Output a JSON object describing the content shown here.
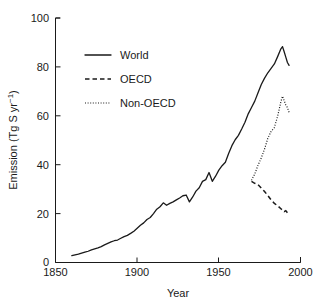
{
  "chart_data": {
    "type": "line",
    "title": "",
    "subtitle": "",
    "xlabel": "Year",
    "ylabel": "Emission (Tg S yr⁻¹)",
    "ylabel_text": "Emission (Tg S yr",
    "ylabel_sup": "−1",
    "ylabel_tail": ")",
    "xlim": [
      1850,
      2000
    ],
    "ylim": [
      0,
      100
    ],
    "grid": false,
    "legend_position": "upper-left-inside",
    "xticks": [
      1850,
      1900,
      1950,
      2000
    ],
    "xtick_labels": [
      "1850",
      "1900",
      "1950",
      "2000"
    ],
    "yticks": [
      0,
      20,
      40,
      60,
      80,
      100
    ],
    "ytick_labels": [
      "0",
      "20",
      "40",
      "60",
      "80",
      "100"
    ],
    "series": [
      {
        "name": "World",
        "style": "solid",
        "color": "#1a1a1a",
        "x": [
          1860,
          1862,
          1864,
          1866,
          1868,
          1870,
          1872,
          1874,
          1876,
          1878,
          1880,
          1882,
          1884,
          1886,
          1888,
          1890,
          1892,
          1894,
          1896,
          1898,
          1900,
          1902,
          1904,
          1906,
          1908,
          1910,
          1912,
          1914,
          1916,
          1918,
          1920,
          1922,
          1924,
          1926,
          1928,
          1930,
          1932,
          1934,
          1936,
          1938,
          1940,
          1942,
          1944,
          1946,
          1948,
          1950,
          1952,
          1954,
          1956,
          1958,
          1960,
          1962,
          1964,
          1966,
          1968,
          1970,
          1972,
          1974,
          1976,
          1978,
          1980,
          1982,
          1984,
          1986,
          1988,
          1989,
          1990,
          1991,
          1992,
          1993
        ],
        "y": [
          2.8,
          3.1,
          3.4,
          3.8,
          4.2,
          4.6,
          5.2,
          5.6,
          6.0,
          6.5,
          7.2,
          7.8,
          8.4,
          8.9,
          9.2,
          9.9,
          10.6,
          11.1,
          11.9,
          12.8,
          14.0,
          15.2,
          16.2,
          17.6,
          18.4,
          20.0,
          21.8,
          22.8,
          24.4,
          23.4,
          24.2,
          24.8,
          25.6,
          26.4,
          27.3,
          27.6,
          24.8,
          26.8,
          29.2,
          30.6,
          33.2,
          33.9,
          36.8,
          33.2,
          35.3,
          37.8,
          39.6,
          41.0,
          44.6,
          47.8,
          50.2,
          52.0,
          54.6,
          57.4,
          60.8,
          63.4,
          66.0,
          69.4,
          72.8,
          75.4,
          77.6,
          79.4,
          81.2,
          84.2,
          87.4,
          88.3,
          86.2,
          84.0,
          81.8,
          80.6
        ]
      },
      {
        "name": "OECD",
        "style": "dashed",
        "color": "#1a1a1a",
        "x": [
          1970,
          1972,
          1974,
          1976,
          1978,
          1980,
          1982,
          1984,
          1986,
          1988,
          1990,
          1991,
          1992,
          1993
        ],
        "y": [
          33.2,
          32.4,
          31.8,
          30.4,
          29.0,
          27.4,
          25.6,
          24.2,
          23.2,
          22.0,
          20.8,
          21.2,
          20.4,
          19.8
        ]
      },
      {
        "name": "Non-OECD",
        "style": "dotted",
        "color": "#1a1a1a",
        "x": [
          1970,
          1972,
          1974,
          1976,
          1978,
          1980,
          1982,
          1984,
          1986,
          1988,
          1989,
          1990,
          1991,
          1992,
          1993
        ],
        "y": [
          33.6,
          36.2,
          39.8,
          42.8,
          46.4,
          50.8,
          53.6,
          55.2,
          59.8,
          65.8,
          68.0,
          66.2,
          64.4,
          63.4,
          61.4
        ]
      }
    ],
    "legend": [
      {
        "label": "World",
        "style": "solid"
      },
      {
        "label": "OECD",
        "style": "dashed"
      },
      {
        "label": "Non-OECD",
        "style": "dotted"
      }
    ]
  }
}
